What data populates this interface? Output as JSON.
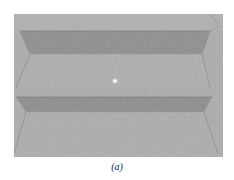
{
  "figure": {
    "caption": "(a)",
    "colors": {
      "tread": "#acacac",
      "riser": "#8e8e8e",
      "edge": "#777777",
      "highlight": "#ffffff"
    }
  }
}
